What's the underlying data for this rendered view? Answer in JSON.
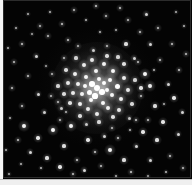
{
  "figure": {
    "kind": "astronomical-image",
    "width": 192,
    "height": 185,
    "background_color": "#040404",
    "star_color": "#ffffff",
    "page_margin_color": "#f2f2f2",
    "rule_color": "#bdbdbd",
    "sky_frame": {
      "x": 3,
      "y": 0,
      "w": 189,
      "h": 179
    },
    "left_margin_strip": {
      "x": 0,
      "y": 0,
      "w": 3,
      "h": 180
    },
    "bottom_margin_strip": {
      "x": 0,
      "y": 179,
      "w": 192,
      "h": 6
    },
    "caption": "",
    "labels": [],
    "annotations": []
  },
  "cluster": {
    "center_x": 97,
    "center_y": 88,
    "core_glow_radius": 46,
    "description": "dense concentration of unresolved and partially resolved stars"
  },
  "stars": [
    {
      "x": 97,
      "y": 88,
      "r": 3.1,
      "b": 1.0
    },
    {
      "x": 92,
      "y": 84,
      "r": 2.8,
      "b": 1.0
    },
    {
      "x": 102,
      "y": 92,
      "r": 2.7,
      "b": 0.98
    },
    {
      "x": 89,
      "y": 92,
      "r": 2.5,
      "b": 0.96
    },
    {
      "x": 104,
      "y": 83,
      "r": 2.4,
      "b": 0.95
    },
    {
      "x": 95,
      "y": 96,
      "r": 2.6,
      "b": 0.97
    },
    {
      "x": 85,
      "y": 86,
      "r": 2.2,
      "b": 0.9
    },
    {
      "x": 107,
      "y": 90,
      "r": 2.3,
      "b": 0.92
    },
    {
      "x": 99,
      "y": 79,
      "r": 2.2,
      "b": 0.9
    },
    {
      "x": 91,
      "y": 100,
      "r": 2.4,
      "b": 0.93
    },
    {
      "x": 82,
      "y": 94,
      "r": 2.0,
      "b": 0.86
    },
    {
      "x": 110,
      "y": 80,
      "r": 2.4,
      "b": 0.93
    },
    {
      "x": 112,
      "y": 95,
      "r": 2.2,
      "b": 0.88
    },
    {
      "x": 86,
      "y": 77,
      "r": 2.1,
      "b": 0.87
    },
    {
      "x": 103,
      "y": 103,
      "r": 2.3,
      "b": 0.9
    },
    {
      "x": 78,
      "y": 84,
      "r": 2.0,
      "b": 0.84
    },
    {
      "x": 117,
      "y": 86,
      "r": 2.5,
      "b": 0.94
    },
    {
      "x": 96,
      "y": 71,
      "r": 2.2,
      "b": 0.88
    },
    {
      "x": 80,
      "y": 104,
      "r": 2.1,
      "b": 0.85
    },
    {
      "x": 113,
      "y": 71,
      "r": 2.3,
      "b": 0.9
    },
    {
      "x": 108,
      "y": 108,
      "r": 2.1,
      "b": 0.85
    },
    {
      "x": 73,
      "y": 93,
      "r": 2.0,
      "b": 0.82
    },
    {
      "x": 88,
      "y": 109,
      "r": 2.0,
      "b": 0.83
    },
    {
      "x": 121,
      "y": 99,
      "r": 2.1,
      "b": 0.85
    },
    {
      "x": 104,
      "y": 64,
      "r": 2.2,
      "b": 0.87
    },
    {
      "x": 75,
      "y": 74,
      "r": 2.1,
      "b": 0.84
    },
    {
      "x": 124,
      "y": 78,
      "r": 2.0,
      "b": 0.83
    },
    {
      "x": 84,
      "y": 65,
      "r": 2.0,
      "b": 0.82
    },
    {
      "x": 97,
      "y": 114,
      "r": 2.0,
      "b": 0.82
    },
    {
      "x": 68,
      "y": 83,
      "r": 1.9,
      "b": 0.8
    },
    {
      "x": 119,
      "y": 110,
      "r": 1.9,
      "b": 0.79
    },
    {
      "x": 70,
      "y": 103,
      "r": 1.8,
      "b": 0.77
    },
    {
      "x": 128,
      "y": 90,
      "r": 1.9,
      "b": 0.8
    },
    {
      "x": 92,
      "y": 60,
      "r": 1.9,
      "b": 0.79
    },
    {
      "x": 113,
      "y": 117,
      "r": 1.8,
      "b": 0.76
    },
    {
      "x": 64,
      "y": 94,
      "r": 1.7,
      "b": 0.74
    },
    {
      "x": 80,
      "y": 116,
      "r": 1.7,
      "b": 0.74
    },
    {
      "x": 124,
      "y": 64,
      "r": 1.8,
      "b": 0.76
    },
    {
      "x": 107,
      "y": 56,
      "r": 1.7,
      "b": 0.74
    },
    {
      "x": 66,
      "y": 70,
      "r": 1.7,
      "b": 0.73
    },
    {
      "x": 132,
      "y": 104,
      "r": 1.7,
      "b": 0.73
    },
    {
      "x": 99,
      "y": 122,
      "r": 1.6,
      "b": 0.71
    },
    {
      "x": 58,
      "y": 86,
      "r": 1.6,
      "b": 0.7
    },
    {
      "x": 118,
      "y": 57,
      "r": 1.6,
      "b": 0.7
    },
    {
      "x": 76,
      "y": 58,
      "r": 1.6,
      "b": 0.69
    },
    {
      "x": 135,
      "y": 80,
      "r": 1.6,
      "b": 0.7
    },
    {
      "x": 86,
      "y": 124,
      "r": 1.5,
      "b": 0.67
    },
    {
      "x": 61,
      "y": 108,
      "r": 1.5,
      "b": 0.66
    },
    {
      "x": 129,
      "y": 118,
      "r": 1.5,
      "b": 0.66
    },
    {
      "x": 93,
      "y": 50,
      "r": 1.5,
      "b": 0.67
    },
    {
      "x": 64,
      "y": 58,
      "r": 1.4,
      "b": 0.64
    },
    {
      "x": 141,
      "y": 96,
      "r": 1.4,
      "b": 0.64
    },
    {
      "x": 112,
      "y": 128,
      "r": 1.4,
      "b": 0.63
    },
    {
      "x": 51,
      "y": 96,
      "r": 1.4,
      "b": 0.62
    },
    {
      "x": 107,
      "y": 46,
      "r": 1.4,
      "b": 0.63
    },
    {
      "x": 78,
      "y": 46,
      "r": 1.3,
      "b": 0.6
    },
    {
      "x": 138,
      "y": 62,
      "r": 1.4,
      "b": 0.63
    },
    {
      "x": 52,
      "y": 74,
      "r": 1.3,
      "b": 0.6
    },
    {
      "x": 24,
      "y": 126,
      "r": 1.9,
      "b": 0.86
    },
    {
      "x": 38,
      "y": 138,
      "r": 1.7,
      "b": 0.8
    },
    {
      "x": 53,
      "y": 130,
      "r": 2.2,
      "b": 0.92
    },
    {
      "x": 30,
      "y": 152,
      "r": 1.5,
      "b": 0.74
    },
    {
      "x": 18,
      "y": 140,
      "r": 1.3,
      "b": 0.66
    },
    {
      "x": 47,
      "y": 158,
      "r": 1.6,
      "b": 0.76
    },
    {
      "x": 64,
      "y": 146,
      "r": 1.6,
      "b": 0.76
    },
    {
      "x": 71,
      "y": 126,
      "r": 2.0,
      "b": 0.88
    },
    {
      "x": 77,
      "y": 160,
      "r": 1.4,
      "b": 0.68
    },
    {
      "x": 60,
      "y": 167,
      "r": 1.7,
      "b": 0.8
    },
    {
      "x": 41,
      "y": 168,
      "r": 1.2,
      "b": 0.6
    },
    {
      "x": 21,
      "y": 164,
      "r": 1.2,
      "b": 0.58
    },
    {
      "x": 88,
      "y": 140,
      "r": 1.7,
      "b": 0.8
    },
    {
      "x": 95,
      "y": 152,
      "r": 1.4,
      "b": 0.68
    },
    {
      "x": 84,
      "y": 170,
      "r": 1.5,
      "b": 0.74
    },
    {
      "x": 104,
      "y": 136,
      "r": 1.5,
      "b": 0.72
    },
    {
      "x": 73,
      "y": 174,
      "r": 1.3,
      "b": 0.64
    },
    {
      "x": 110,
      "y": 150,
      "r": 2.0,
      "b": 0.88
    },
    {
      "x": 118,
      "y": 138,
      "r": 1.4,
      "b": 0.68
    },
    {
      "x": 124,
      "y": 160,
      "r": 1.6,
      "b": 0.76
    },
    {
      "x": 101,
      "y": 166,
      "r": 1.3,
      "b": 0.64
    },
    {
      "x": 136,
      "y": 146,
      "r": 1.5,
      "b": 0.72
    },
    {
      "x": 143,
      "y": 132,
      "r": 1.7,
      "b": 0.8
    },
    {
      "x": 131,
      "y": 172,
      "r": 1.4,
      "b": 0.68
    },
    {
      "x": 150,
      "y": 160,
      "r": 1.5,
      "b": 0.72
    },
    {
      "x": 157,
      "y": 140,
      "r": 1.6,
      "b": 0.76
    },
    {
      "x": 163,
      "y": 122,
      "r": 1.7,
      "b": 0.8
    },
    {
      "x": 170,
      "y": 156,
      "r": 1.4,
      "b": 0.68
    },
    {
      "x": 178,
      "y": 134,
      "r": 1.5,
      "b": 0.72
    },
    {
      "x": 166,
      "y": 172,
      "r": 1.2,
      "b": 0.6
    },
    {
      "x": 148,
      "y": 120,
      "r": 1.3,
      "b": 0.64
    },
    {
      "x": 182,
      "y": 112,
      "r": 1.5,
      "b": 0.72
    },
    {
      "x": 174,
      "y": 98,
      "r": 1.7,
      "b": 0.8
    },
    {
      "x": 183,
      "y": 168,
      "r": 1.3,
      "b": 0.62
    },
    {
      "x": 155,
      "y": 106,
      "r": 1.6,
      "b": 0.76
    },
    {
      "x": 168,
      "y": 84,
      "r": 1.5,
      "b": 0.72
    },
    {
      "x": 179,
      "y": 70,
      "r": 1.4,
      "b": 0.68
    },
    {
      "x": 186,
      "y": 54,
      "r": 1.3,
      "b": 0.62
    },
    {
      "x": 160,
      "y": 60,
      "r": 1.4,
      "b": 0.68
    },
    {
      "x": 172,
      "y": 44,
      "r": 1.3,
      "b": 0.64
    },
    {
      "x": 150,
      "y": 44,
      "r": 1.5,
      "b": 0.72
    },
    {
      "x": 158,
      "y": 28,
      "r": 1.3,
      "b": 0.62
    },
    {
      "x": 140,
      "y": 32,
      "r": 1.4,
      "b": 0.66
    },
    {
      "x": 146,
      "y": 14,
      "r": 1.5,
      "b": 0.72
    },
    {
      "x": 128,
      "y": 20,
      "r": 1.3,
      "b": 0.62
    },
    {
      "x": 120,
      "y": 8,
      "r": 1.4,
      "b": 0.66
    },
    {
      "x": 106,
      "y": 16,
      "r": 1.3,
      "b": 0.62
    },
    {
      "x": 96,
      "y": 6,
      "r": 1.4,
      "b": 0.68
    },
    {
      "x": 86,
      "y": 20,
      "r": 1.2,
      "b": 0.58
    },
    {
      "x": 74,
      "y": 10,
      "r": 1.3,
      "b": 0.62
    },
    {
      "x": 62,
      "y": 24,
      "r": 1.4,
      "b": 0.66
    },
    {
      "x": 50,
      "y": 12,
      "r": 1.2,
      "b": 0.58
    },
    {
      "x": 40,
      "y": 26,
      "r": 1.3,
      "b": 0.62
    },
    {
      "x": 28,
      "y": 14,
      "r": 1.2,
      "b": 0.56
    },
    {
      "x": 16,
      "y": 28,
      "r": 1.2,
      "b": 0.56
    },
    {
      "x": 22,
      "y": 44,
      "r": 1.4,
      "b": 0.66
    },
    {
      "x": 36,
      "y": 56,
      "r": 1.5,
      "b": 0.72
    },
    {
      "x": 14,
      "y": 62,
      "r": 1.3,
      "b": 0.62
    },
    {
      "x": 28,
      "y": 76,
      "r": 1.4,
      "b": 0.66
    },
    {
      "x": 12,
      "y": 88,
      "r": 1.3,
      "b": 0.62
    },
    {
      "x": 38,
      "y": 94,
      "r": 1.5,
      "b": 0.72
    },
    {
      "x": 22,
      "y": 106,
      "r": 1.4,
      "b": 0.66
    },
    {
      "x": 44,
      "y": 112,
      "r": 1.5,
      "b": 0.7
    },
    {
      "x": 10,
      "y": 118,
      "r": 1.2,
      "b": 0.56
    },
    {
      "x": 48,
      "y": 36,
      "r": 1.3,
      "b": 0.62
    },
    {
      "x": 68,
      "y": 40,
      "r": 1.4,
      "b": 0.66
    },
    {
      "x": 126,
      "y": 44,
      "r": 1.6,
      "b": 0.76
    },
    {
      "x": 134,
      "y": 58,
      "r": 1.5,
      "b": 0.72
    },
    {
      "x": 145,
      "y": 74,
      "r": 2.1,
      "b": 0.9
    },
    {
      "x": 150,
      "y": 86,
      "r": 1.9,
      "b": 0.84
    },
    {
      "x": 141,
      "y": 88,
      "r": 1.7,
      "b": 0.78
    },
    {
      "x": 136,
      "y": 120,
      "r": 1.4,
      "b": 0.66
    },
    {
      "x": 60,
      "y": 120,
      "r": 1.3,
      "b": 0.62
    },
    {
      "x": 8,
      "y": 48,
      "r": 1.2,
      "b": 0.56
    },
    {
      "x": 184,
      "y": 26,
      "r": 1.2,
      "b": 0.58
    },
    {
      "x": 176,
      "y": 12,
      "r": 1.2,
      "b": 0.56
    },
    {
      "x": 6,
      "y": 150,
      "r": 1.2,
      "b": 0.56
    },
    {
      "x": 9,
      "y": 174,
      "r": 1.2,
      "b": 0.54
    },
    {
      "x": 116,
      "y": 176,
      "r": 1.2,
      "b": 0.56
    },
    {
      "x": 148,
      "y": 176,
      "r": 1.1,
      "b": 0.52
    },
    {
      "x": 58,
      "y": 102,
      "r": 1.3,
      "b": 0.62
    },
    {
      "x": 66,
      "y": 112,
      "r": 1.2,
      "b": 0.58
    },
    {
      "x": 130,
      "y": 130,
      "r": 1.2,
      "b": 0.58
    },
    {
      "x": 154,
      "y": 70,
      "r": 1.2,
      "b": 0.58
    },
    {
      "x": 164,
      "y": 104,
      "r": 1.2,
      "b": 0.56
    },
    {
      "x": 100,
      "y": 32,
      "r": 1.2,
      "b": 0.58
    },
    {
      "x": 116,
      "y": 30,
      "r": 1.1,
      "b": 0.54
    },
    {
      "x": 46,
      "y": 66,
      "r": 1.1,
      "b": 0.52
    },
    {
      "x": 32,
      "y": 34,
      "r": 1.1,
      "b": 0.52
    }
  ]
}
